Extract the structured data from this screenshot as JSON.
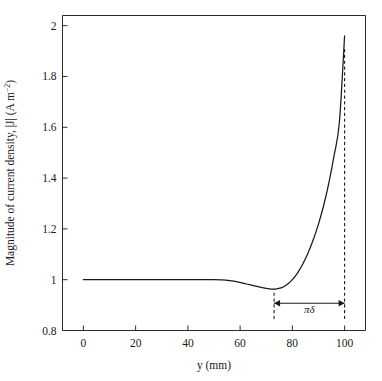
{
  "chart_data": {
    "type": "line",
    "title": "",
    "subtitle": "",
    "xlabel": "y (mm)",
    "ylabel": "Magnitude of current density, |J| (A m⁻²)",
    "ylabel_parts": {
      "main": "Magnitude of current density, |J| (A m",
      "superscript": "−2",
      "tail": ")"
    },
    "xlim": [
      -8,
      108
    ],
    "ylim": [
      0.8,
      2.04
    ],
    "grid": false,
    "legend": null,
    "xticks": [
      0,
      20,
      40,
      60,
      80,
      100
    ],
    "xtick_labels": [
      "0",
      "20",
      "40",
      "60",
      "80",
      "100"
    ],
    "yticks": [
      0.8,
      1.0,
      1.2,
      1.4,
      1.6,
      1.8,
      2.0
    ],
    "ytick_labels": [
      "0.8",
      "1",
      "1.2",
      "1.4",
      "1.6",
      "1.8",
      "2"
    ],
    "series": [
      {
        "name": "|J|",
        "color": "#1a1a1a",
        "x": [
          0,
          5,
          10,
          15,
          20,
          25,
          30,
          35,
          40,
          45,
          50,
          53,
          56,
          59,
          62,
          65,
          68,
          70,
          72,
          73,
          74,
          76,
          78,
          80,
          82,
          84,
          86,
          88,
          90,
          92,
          94,
          96,
          98,
          100
        ],
        "y": [
          1.0,
          1.0,
          1.0,
          1.0,
          1.0,
          1.0,
          1.0,
          1.0,
          1.0,
          1.0,
          1.0,
          0.999,
          0.996,
          0.991,
          0.984,
          0.977,
          0.97,
          0.966,
          0.963,
          0.963,
          0.964,
          0.969,
          0.981,
          1.0,
          1.027,
          1.062,
          1.105,
          1.157,
          1.219,
          1.293,
          1.382,
          1.49,
          1.62,
          1.96
        ]
      }
    ],
    "annotations": [
      {
        "name": "skin-depth-span",
        "label": "πδ",
        "x_start": 73,
        "x_end": 100,
        "arrow_y": 0.907,
        "label_x": 86.5,
        "label_y": 0.868
      }
    ],
    "guide_lines": [
      {
        "name": "left-marker",
        "x": 73,
        "y_bottom": 0.845,
        "y_top": 0.963
      },
      {
        "name": "right-marker",
        "x": 100,
        "y_bottom": 0.845,
        "y_top": 1.92
      }
    ]
  }
}
